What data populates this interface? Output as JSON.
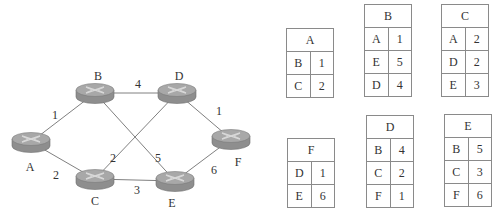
{
  "diagram": {
    "routers": [
      {
        "id": "A",
        "label": "A",
        "x": 31,
        "y": 142,
        "label_x": 30,
        "label_y": 167
      },
      {
        "id": "B",
        "label": "B",
        "x": 95,
        "y": 93,
        "label_x": 98,
        "label_y": 76
      },
      {
        "id": "C",
        "label": "C",
        "x": 95,
        "y": 179,
        "label_x": 95,
        "label_y": 201
      },
      {
        "id": "D",
        "label": "D",
        "x": 177,
        "y": 93,
        "label_x": 179,
        "label_y": 76
      },
      {
        "id": "E",
        "label": "E",
        "x": 175,
        "y": 181,
        "label_x": 172,
        "label_y": 203
      },
      {
        "id": "F",
        "label": "F",
        "x": 231,
        "y": 139,
        "label_x": 238,
        "label_y": 162
      }
    ],
    "links": [
      {
        "from": "A",
        "to": "B",
        "cost": "1",
        "lx": 55,
        "ly": 115
      },
      {
        "from": "A",
        "to": "C",
        "cost": "2",
        "lx": 56,
        "ly": 175
      },
      {
        "from": "B",
        "to": "D",
        "cost": "4",
        "lx": 138,
        "ly": 84
      },
      {
        "from": "B",
        "to": "E",
        "cost": "5",
        "lx": 158,
        "ly": 158
      },
      {
        "from": "C",
        "to": "D",
        "cost": "2",
        "lx": 113,
        "ly": 158
      },
      {
        "from": "C",
        "to": "E",
        "cost": "3",
        "lx": 137,
        "ly": 190
      },
      {
        "from": "D",
        "to": "F",
        "cost": "1",
        "lx": 219,
        "ly": 111
      },
      {
        "from": "E",
        "to": "F",
        "cost": "6",
        "lx": 214,
        "ly": 170
      }
    ],
    "colors": {
      "link": "#808080",
      "router_top": "#a8a8a8",
      "router_side": "#8e8e8e",
      "router_mark": "#d8d8d8"
    }
  },
  "tables": [
    {
      "id": "A",
      "title": "A",
      "x": 286,
      "y": 28,
      "rows": [
        [
          "B",
          "1"
        ],
        [
          "C",
          "2"
        ]
      ]
    },
    {
      "id": "B",
      "title": "B",
      "x": 364,
      "y": 4,
      "rows": [
        [
          "A",
          "1"
        ],
        [
          "E",
          "5"
        ],
        [
          "D",
          "4"
        ]
      ]
    },
    {
      "id": "C",
      "title": "C",
      "x": 441,
      "y": 4,
      "rows": [
        [
          "A",
          "2"
        ],
        [
          "D",
          "2"
        ],
        [
          "E",
          "3"
        ]
      ]
    },
    {
      "id": "F",
      "title": "F",
      "x": 287,
      "y": 138,
      "rows": [
        [
          "D",
          "1"
        ],
        [
          "E",
          "6"
        ]
      ]
    },
    {
      "id": "D",
      "title": "D",
      "x": 366,
      "y": 115,
      "rows": [
        [
          "B",
          "4"
        ],
        [
          "C",
          "2"
        ],
        [
          "F",
          "1"
        ]
      ]
    },
    {
      "id": "E",
      "title": "E",
      "x": 444,
      "y": 114,
      "rows": [
        [
          "B",
          "5"
        ],
        [
          "C",
          "3"
        ],
        [
          "F",
          "6"
        ]
      ]
    }
  ]
}
